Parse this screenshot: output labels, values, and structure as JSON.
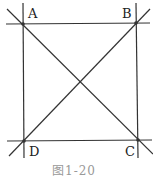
{
  "figure": {
    "points": {
      "A": {
        "label": "A",
        "x": 23,
        "y": 24
      },
      "B": {
        "label": "B",
        "x": 136,
        "y": 23
      },
      "C": {
        "label": "C",
        "x": 138,
        "y": 140
      },
      "D": {
        "label": "D",
        "x": 24,
        "y": 141
      }
    },
    "caption": "图1-20",
    "line_color": "#333333"
  }
}
